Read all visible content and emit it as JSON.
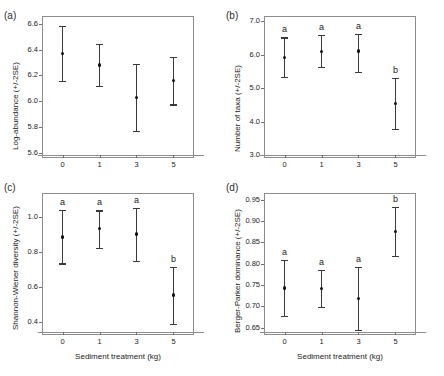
{
  "figure": {
    "xlabel": "Sediment treatment (kg)",
    "categories": [
      "0",
      "1",
      "3",
      "5"
    ]
  },
  "chart_data": [
    {
      "type": "scatter",
      "panel": "(a)",
      "title": "",
      "xlabel": "",
      "ylabel": "Log-abundance (+/-2SE)",
      "categories": [
        "0",
        "1",
        "3",
        "5"
      ],
      "values": [
        6.37,
        6.28,
        6.03,
        6.16
      ],
      "err_low": [
        6.155,
        6.12,
        5.77,
        5.975
      ],
      "err_high": [
        6.585,
        6.445,
        6.29,
        6.345
      ],
      "letters": [
        "",
        "",
        "",
        ""
      ],
      "yticks": [
        "5.6",
        "5.8",
        "6.0",
        "6.2",
        "6.4",
        "6.6"
      ],
      "ytickvals": [
        5.6,
        5.8,
        6.0,
        6.2,
        6.4,
        6.6
      ],
      "ylim": [
        5.56,
        6.66
      ],
      "grid": false,
      "legend": "none"
    },
    {
      "type": "scatter",
      "panel": "(b)",
      "title": "",
      "xlabel": "",
      "ylabel": "Number of taxa (+/-2SE)",
      "categories": [
        "0",
        "1",
        "3",
        "5"
      ],
      "values": [
        5.92,
        6.1,
        6.11,
        4.55
      ],
      "err_low": [
        5.35,
        5.64,
        5.48,
        3.8
      ],
      "err_high": [
        6.52,
        6.6,
        6.62,
        5.32
      ],
      "letters": [
        "a",
        "a",
        "a",
        "b"
      ],
      "yticks": [
        "3.0",
        "4.0",
        "5.0",
        "6.0",
        "7.0"
      ],
      "ytickvals": [
        3.0,
        4.0,
        5.0,
        6.0,
        7.0
      ],
      "ylim": [
        2.92,
        7.16
      ],
      "grid": false,
      "legend": "none"
    },
    {
      "type": "scatter",
      "panel": "(c)",
      "title": "",
      "xlabel": "Sediment treatment (kg)",
      "ylabel": "Shannon-Wiener diversity (+/-2SE)",
      "categories": [
        "0",
        "1",
        "3",
        "5"
      ],
      "values": [
        0.883,
        0.932,
        0.9,
        0.553
      ],
      "err_low": [
        0.733,
        0.823,
        0.746,
        0.388
      ],
      "err_high": [
        1.037,
        1.036,
        1.048,
        0.715
      ],
      "letters": [
        "a",
        "a",
        "a",
        "b"
      ],
      "yticks": [
        "0.4",
        "0.6",
        "0.8",
        "1.0"
      ],
      "ytickvals": [
        0.4,
        0.6,
        0.8,
        1.0
      ],
      "ylim": [
        0.325,
        1.135
      ],
      "grid": false,
      "legend": "none"
    },
    {
      "type": "scatter",
      "panel": "(d)",
      "title": "",
      "xlabel": "Sediment treatment (kg)",
      "ylabel": "Berger-Parker dominance (+/-2SE)",
      "categories": [
        "0",
        "1",
        "3",
        "5"
      ],
      "values": [
        0.743,
        0.742,
        0.719,
        0.876
      ],
      "err_low": [
        0.677,
        0.699,
        0.645,
        0.819
      ],
      "err_high": [
        0.81,
        0.786,
        0.792,
        0.934
      ],
      "letters": [
        "a",
        "a",
        "a",
        "b"
      ],
      "yticks": [
        "0.65",
        "0.70",
        "0.75",
        "0.80",
        "0.85",
        "0.90",
        "0.95"
      ],
      "ytickvals": [
        0.65,
        0.7,
        0.75,
        0.8,
        0.85,
        0.9,
        0.95
      ],
      "ylim": [
        0.633,
        0.966
      ],
      "grid": false,
      "legend": "none"
    }
  ]
}
